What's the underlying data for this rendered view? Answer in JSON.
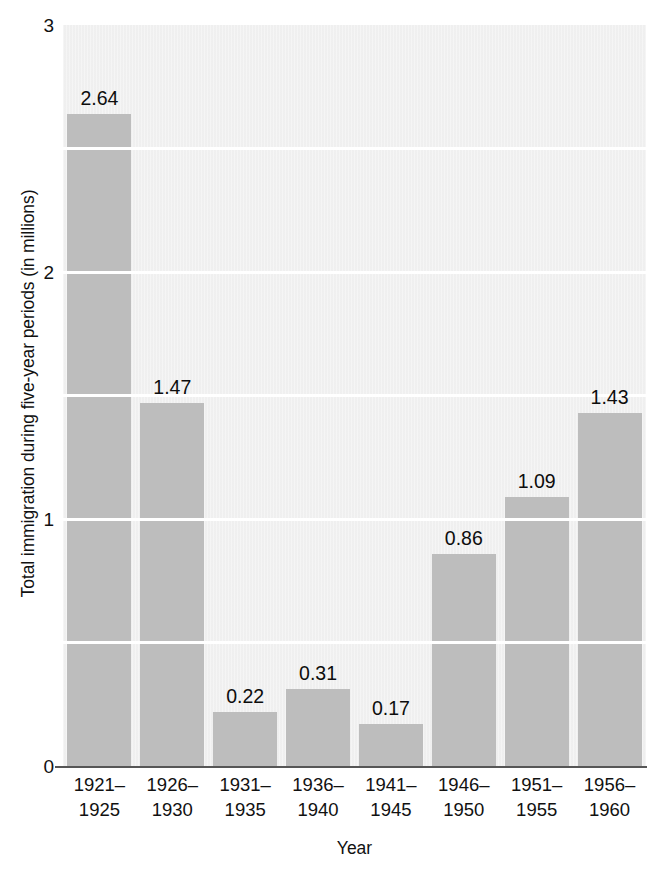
{
  "chart_data": {
    "type": "bar",
    "title": "",
    "subtitle": "",
    "xlabel": "Year",
    "ylabel": "Total immigration during five-year periods (in millions)",
    "categories": [
      "1921–\n1925",
      "1926–\n1930",
      "1931–\n1935",
      "1936–\n1940",
      "1941–\n1945",
      "1946–\n1950",
      "1951–\n1955",
      "1956–\n1960"
    ],
    "category_lines": [
      [
        "1921–",
        "1925"
      ],
      [
        "1926–",
        "1930"
      ],
      [
        "1931–",
        "1935"
      ],
      [
        "1936–",
        "1940"
      ],
      [
        "1941–",
        "1945"
      ],
      [
        "1946–",
        "1950"
      ],
      [
        "1951–",
        "1955"
      ],
      [
        "1956–",
        "1960"
      ]
    ],
    "values": [
      2.64,
      1.47,
      0.22,
      0.31,
      0.17,
      0.86,
      1.09,
      1.43
    ],
    "value_labels": [
      "2.64",
      "1.47",
      "0.22",
      "0.31",
      "0.17",
      "0.86",
      "1.09",
      "1.43"
    ],
    "ylim": [
      0,
      3
    ],
    "xlim_note": "categorical",
    "y_major_ticks": [
      0,
      1,
      2,
      3
    ],
    "y_major_tick_labels": [
      "0",
      "1",
      "2",
      "3"
    ],
    "y_minor_gridlines": [
      0.5,
      1.0,
      1.5,
      2.0,
      2.5
    ],
    "grid": "horizontal-white-lines-only",
    "legend": "none",
    "legend_position": "none",
    "bar_color": "#bdbdbd",
    "plot_background": "#f1f1f1",
    "gridline_color": "#ffffff",
    "axis_color": "#565656",
    "text_color": "#111111"
  },
  "axes": {
    "y_title": "Total immigration during five-year periods (in millions)",
    "x_title": "Year"
  }
}
